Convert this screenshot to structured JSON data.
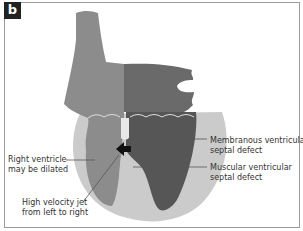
{
  "figure": {
    "panel_label": "b",
    "labels": {
      "membranous": [
        "Membranous ventricular",
        "septal defect"
      ],
      "muscular": [
        "Muscular ventricular",
        "septal defect"
      ],
      "right_ventricle": [
        "Right ventricle",
        "may be dilated"
      ],
      "jet": [
        "High velocity jet",
        "from left to right"
      ]
    },
    "colors": {
      "outer_heart": "#c9c9c9",
      "right_side": "#8a8a8a",
      "left_side": "#5e5e5e",
      "line": "#555555",
      "badge": "#222222"
    }
  }
}
